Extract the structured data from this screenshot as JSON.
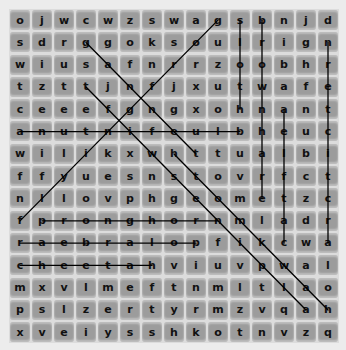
{
  "puzzle": {
    "rows": 15,
    "cols": 15,
    "grid": [
      [
        "o",
        "j",
        "w",
        "c",
        "w",
        "z",
        "s",
        "w",
        "a",
        "g",
        "s",
        "b",
        "n",
        "j",
        "d"
      ],
      [
        "s",
        "d",
        "r",
        "g",
        "g",
        "o",
        "k",
        "s",
        "o",
        "u",
        "l",
        "r",
        "i",
        "g",
        "n"
      ],
      [
        "w",
        "i",
        "u",
        "s",
        "a",
        "f",
        "n",
        "r",
        "r",
        "z",
        "o",
        "o",
        "b",
        "h",
        "r"
      ],
      [
        "t",
        "z",
        "t",
        "t",
        "j",
        "n",
        "f",
        "j",
        "x",
        "u",
        "t",
        "w",
        "a",
        "f",
        "e"
      ],
      [
        "c",
        "e",
        "e",
        "e",
        "f",
        "g",
        "n",
        "g",
        "x",
        "o",
        "h",
        "n",
        "a",
        "n",
        "t"
      ],
      [
        "a",
        "n",
        "u",
        "t",
        "n",
        "i",
        "f",
        "e",
        "u",
        "l",
        "b",
        "h",
        "e",
        "u",
        "c"
      ],
      [
        "w",
        "i",
        "l",
        "i",
        "k",
        "x",
        "w",
        "h",
        "t",
        "t",
        "u",
        "a",
        "l",
        "b",
        "i"
      ],
      [
        "f",
        "f",
        "y",
        "u",
        "e",
        "s",
        "n",
        "s",
        "t",
        "o",
        "v",
        "r",
        "f",
        "c",
        "t"
      ],
      [
        "n",
        "l",
        "l",
        "o",
        "v",
        "p",
        "h",
        "g",
        "e",
        "o",
        "m",
        "e",
        "t",
        "z",
        "c"
      ],
      [
        "f",
        "p",
        "r",
        "o",
        "n",
        "g",
        "h",
        "o",
        "r",
        "n",
        "m",
        "l",
        "a",
        "d",
        "r"
      ],
      [
        "r",
        "a",
        "e",
        "b",
        "r",
        "a",
        "l",
        "o",
        "p",
        "f",
        "i",
        "k",
        "c",
        "w",
        "a"
      ],
      [
        "c",
        "h",
        "e",
        "e",
        "t",
        "a",
        "h",
        "v",
        "i",
        "u",
        "v",
        "p",
        "w",
        "a",
        "l"
      ],
      [
        "m",
        "x",
        "v",
        "l",
        "m",
        "e",
        "f",
        "t",
        "n",
        "m",
        "l",
        "t",
        "l",
        "a",
        "o"
      ],
      [
        "p",
        "s",
        "l",
        "z",
        "e",
        "r",
        "t",
        "y",
        "r",
        "m",
        "z",
        "v",
        "q",
        "a",
        "h"
      ],
      [
        "x",
        "v",
        "e",
        "i",
        "y",
        "s",
        "s",
        "h",
        "k",
        "o",
        "t",
        "n",
        "v",
        "z",
        "q"
      ]
    ],
    "found_words": [
      {
        "word": "flyingfrog",
        "start": [
          9,
          0
        ],
        "end": [
          0,
          9
        ]
      },
      {
        "word": "gannet",
        "start": [
          1,
          3
        ],
        "end": [
          6,
          8
        ]
      },
      {
        "word": "bluefintuna",
        "start": [
          5,
          10
        ],
        "end": [
          5,
          0
        ]
      },
      {
        "word": "sloth",
        "start": [
          0,
          10
        ],
        "end": [
          4,
          10
        ]
      },
      {
        "word": "brownhare",
        "start": [
          0,
          11
        ],
        "end": [
          8,
          11
        ]
      },
      {
        "word": "catflea",
        "start": [
          10,
          12
        ],
        "end": [
          4,
          12
        ]
      },
      {
        "word": "arctictern",
        "start": [
          10,
          14
        ],
        "end": [
          1,
          14
        ]
      },
      {
        "word": "pronghorn",
        "start": [
          9,
          1
        ],
        "end": [
          9,
          9
        ]
      },
      {
        "word": "polarbear",
        "start": [
          10,
          8
        ],
        "end": [
          10,
          0
        ]
      },
      {
        "word": "cheetah",
        "start": [
          11,
          0
        ],
        "end": [
          11,
          6
        ]
      },
      {
        "word": "alpineswift",
        "start": [
          13,
          13
        ],
        "end": [
          3,
          3
        ]
      },
      {
        "word": "hawkmoth",
        "start": [
          13,
          14
        ],
        "end": [
          6,
          7
        ]
      }
    ],
    "colors": {
      "background": "#ececec",
      "cell": "#9c9c9c",
      "separator": "#dcdcdc",
      "line": "#000000",
      "letter": "#111111"
    }
  }
}
